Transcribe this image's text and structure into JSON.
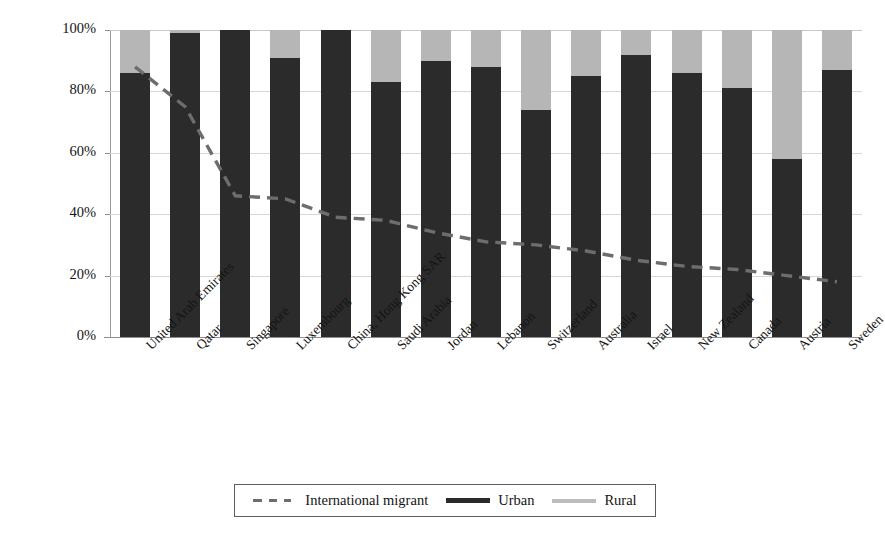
{
  "chart_data": {
    "type": "bar",
    "title": "",
    "subtitle": "",
    "xlabel": "",
    "ylabel": "% of total population",
    "ylim": [
      0,
      100
    ],
    "ytick_labels": [
      "100%",
      "80%",
      "60%",
      "40%",
      "20%",
      "0%"
    ],
    "ytick_values": [
      100,
      80,
      60,
      40,
      20,
      0
    ],
    "grid": true,
    "legend_position": "bottom",
    "stacked": true,
    "categories": [
      "United Arab Emirates",
      "Qatar",
      "Singapore",
      "Luxembourg",
      "China, Hong Kong SAR",
      "Saudi Arabia",
      "Jordan",
      "Lebanon",
      "Switzerland",
      "Australia",
      "Israel",
      "New Zealand",
      "Canada",
      "Austria",
      "Sweden"
    ],
    "series": [
      {
        "name": "Urban",
        "type": "bar",
        "color": "#2b2b2b",
        "values": [
          86,
          99,
          100,
          91,
          100,
          83,
          90,
          88,
          74,
          85,
          92,
          86,
          81,
          58,
          87
        ]
      },
      {
        "name": "Rural",
        "type": "bar",
        "color": "#b6b6b6",
        "values": [
          14,
          1,
          0,
          9,
          0,
          17,
          10,
          12,
          26,
          15,
          8,
          14,
          19,
          42,
          13
        ]
      },
      {
        "name": "International migrant",
        "type": "line",
        "style": "dashed",
        "color": "#6d6d6d",
        "values": [
          88,
          75,
          46,
          45,
          39,
          38,
          34,
          31,
          30,
          28,
          25,
          23,
          22,
          20,
          18
        ]
      }
    ]
  },
  "legend": {
    "entries": [
      {
        "label": "International migrant",
        "marker": "dashed-line-swatch"
      },
      {
        "label": "Urban",
        "marker": "solid-dark-line-swatch"
      },
      {
        "label": "Rural",
        "marker": "light-gray-line-swatch"
      }
    ]
  },
  "colors": {
    "urban": "#2b2b2b",
    "rural": "#b6b6b6",
    "migrant_line": "#6d6d6d",
    "gridline": "#d7d7d7",
    "axis": "#8f8f8f",
    "text": "#141414",
    "background": "#ffffff"
  }
}
